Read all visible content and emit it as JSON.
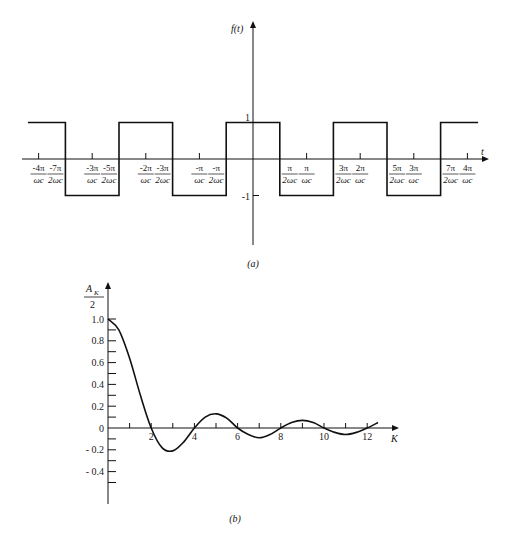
{
  "chart_data": [
    {
      "id": "a",
      "type": "line",
      "title": "",
      "caption": "(a)",
      "ylabel": "f(t)",
      "xlabel": "t",
      "description": "Periodic square wave f(t) alternating between +1 and -1, centered pulse of +1 for |t| < pi/(2 omega_c)",
      "y_ticks": [
        {
          "value": 1,
          "label": "1"
        },
        {
          "value": -1,
          "label": "-1"
        }
      ],
      "x_ticks": [
        {
          "value": -4.0,
          "num": "-4π",
          "den": "ωc"
        },
        {
          "value": -3.5,
          "num": "-7π",
          "den": "2ωc"
        },
        {
          "value": -3.0,
          "num": "-3π",
          "den": "ωc"
        },
        {
          "value": -2.5,
          "num": "-5π",
          "den": "2ωc"
        },
        {
          "value": -2.0,
          "num": "-2π",
          "den": "ωc"
        },
        {
          "value": -1.5,
          "num": "-3π",
          "den": "2ωc"
        },
        {
          "value": -1.0,
          "num": "-π",
          "den": "ωc"
        },
        {
          "value": -0.5,
          "num": "-π",
          "den": "2ωc"
        },
        {
          "value": 0.5,
          "num": "π",
          "den": "2ωc"
        },
        {
          "value": 1.0,
          "num": "π",
          "den": "ωc"
        },
        {
          "value": 1.5,
          "num": "3π",
          "den": "2ωc"
        },
        {
          "value": 2.0,
          "num": "2π",
          "den": "ωc"
        },
        {
          "value": 2.5,
          "num": "5π",
          "den": "2ωc"
        },
        {
          "value": 3.0,
          "num": "3π",
          "den": "ωc"
        },
        {
          "value": 3.5,
          "num": "7π",
          "den": "2ωc"
        },
        {
          "value": 4.0,
          "num": "4π",
          "den": "ωc"
        }
      ],
      "x_unit_note": "x values in units of pi/omega_c",
      "segments": [
        {
          "x_start": -4.2,
          "x_end": -3.5,
          "y": 1
        },
        {
          "x_start": -3.5,
          "x_end": -2.5,
          "y": -1
        },
        {
          "x_start": -2.5,
          "x_end": -1.5,
          "y": 1
        },
        {
          "x_start": -1.5,
          "x_end": -0.5,
          "y": -1
        },
        {
          "x_start": -0.5,
          "x_end": 0.5,
          "y": 1
        },
        {
          "x_start": 0.5,
          "x_end": 1.5,
          "y": -1
        },
        {
          "x_start": 1.5,
          "x_end": 2.5,
          "y": 1
        },
        {
          "x_start": 2.5,
          "x_end": 3.5,
          "y": -1
        },
        {
          "x_start": 3.5,
          "x_end": 4.2,
          "y": 1
        }
      ],
      "ylim": [
        -1.5,
        1.5
      ],
      "grid": false,
      "legend": null
    },
    {
      "id": "b",
      "type": "line",
      "title": "",
      "caption": "(b)",
      "ylabel_num": "A",
      "ylabel_sub": "K",
      "ylabel_den": "2",
      "xlabel": "K",
      "description": "Normalized Fourier coefficients A_K/2 versus K, a sinc-like decaying oscillation",
      "y_ticks": [
        {
          "value": 1.0,
          "label": "1.0"
        },
        {
          "value": 0.8,
          "label": "0.8"
        },
        {
          "value": 0.6,
          "label": "0.6"
        },
        {
          "value": 0.4,
          "label": "0.4"
        },
        {
          "value": 0.2,
          "label": "0.2"
        },
        {
          "value": 0,
          "label": "0"
        },
        {
          "value": -0.2,
          "label": "- 0.2"
        },
        {
          "value": -0.4,
          "label": "- 0.4"
        }
      ],
      "x_ticks": [
        {
          "value": 2,
          "label": "2"
        },
        {
          "value": 4,
          "label": "4"
        },
        {
          "value": 6,
          "label": "6"
        },
        {
          "value": 8,
          "label": "8"
        },
        {
          "value": 10,
          "label": "10"
        },
        {
          "value": 12,
          "label": "12"
        }
      ],
      "x": [
        0,
        0.5,
        1,
        1.5,
        2,
        2.5,
        3,
        3.5,
        4,
        4.5,
        5,
        5.5,
        6,
        6.5,
        7,
        7.5,
        8,
        8.5,
        9,
        9.5,
        10,
        10.5,
        11,
        11.5,
        12,
        12.5
      ],
      "values": [
        1.0,
        0.9,
        0.64,
        0.3,
        0.0,
        -0.18,
        -0.21,
        -0.13,
        0.0,
        0.1,
        0.13,
        0.09,
        0.0,
        -0.06,
        -0.09,
        -0.06,
        0.0,
        0.05,
        0.07,
        0.05,
        0.0,
        -0.04,
        -0.06,
        -0.04,
        0.0,
        0.05
      ],
      "xlim": [
        0,
        13
      ],
      "ylim": [
        -0.6,
        1.1
      ],
      "grid": false,
      "legend": null
    }
  ]
}
